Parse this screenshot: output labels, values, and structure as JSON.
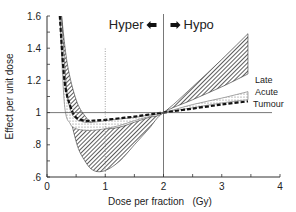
{
  "chart_data": {
    "type": "area",
    "title": "",
    "xlabel": "Dose per fraction   (Gy)",
    "ylabel": "Effect per unit dose",
    "xlim": [
      0,
      4
    ],
    "ylim": [
      0.6,
      1.6
    ],
    "xticks": [
      0,
      1,
      2,
      3,
      4
    ],
    "xtick_labels": [
      "0",
      "1",
      "2",
      "3",
      "4"
    ],
    "yticks": [
      0.6,
      0.8,
      1.0,
      1.2,
      1.4,
      1.6
    ],
    "ytick_labels": [
      ".6",
      ".8",
      "1",
      "1.2",
      "1.4",
      "1.6"
    ],
    "reference_line_y": 1.0,
    "reference_line_x": 2.0,
    "dotted_line_x": 1.0,
    "annotations": {
      "hyper": "Hyper",
      "hypo": "Hypo"
    },
    "grid": false,
    "series": [
      {
        "name": "Late",
        "kind": "band",
        "x": [
          0.25,
          0.35,
          0.5,
          0.65,
          0.8,
          1.0,
          1.25,
          1.5,
          1.75,
          2.0,
          2.5,
          3.0,
          3.45
        ],
        "upper": [
          1.6,
          1.3,
          1.08,
          0.98,
          0.93,
          0.9,
          0.91,
          0.94,
          0.97,
          1.0,
          1.16,
          1.33,
          1.49
        ],
        "lower": [
          1.6,
          1.1,
          0.82,
          0.7,
          0.64,
          0.64,
          0.7,
          0.8,
          0.9,
          1.0,
          1.08,
          1.16,
          1.24
        ]
      },
      {
        "name": "Acute",
        "kind": "band",
        "x": [
          0.22,
          0.3,
          0.4,
          0.5,
          0.65,
          0.8,
          1.0,
          1.25,
          1.5,
          1.75,
          2.0,
          2.5,
          3.0,
          3.45
        ],
        "upper": [
          1.6,
          1.2,
          1.02,
          0.96,
          0.94,
          0.94,
          0.95,
          0.96,
          0.97,
          0.985,
          1.0,
          1.05,
          1.09,
          1.13
        ],
        "lower": [
          1.6,
          1.05,
          0.93,
          0.9,
          0.89,
          0.89,
          0.9,
          0.92,
          0.95,
          0.975,
          1.0,
          1.03,
          1.06,
          1.08
        ]
      },
      {
        "name": "Tumour",
        "kind": "line",
        "style": "dashed",
        "x": [
          0.22,
          0.3,
          0.4,
          0.5,
          0.65,
          0.8,
          1.0,
          1.25,
          1.5,
          1.75,
          2.0,
          2.5,
          3.0,
          3.45
        ],
        "y": [
          1.6,
          1.2,
          1.04,
          0.97,
          0.95,
          0.95,
          0.955,
          0.965,
          0.975,
          0.988,
          1.0,
          1.025,
          1.05,
          1.07
        ]
      }
    ],
    "legend": "inline-right"
  }
}
